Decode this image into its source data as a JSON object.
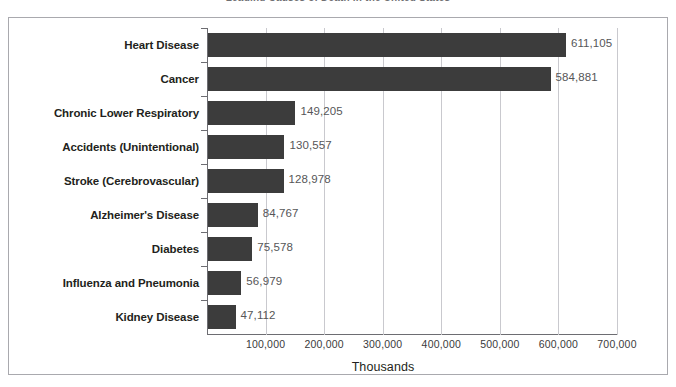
{
  "chart_data": {
    "type": "bar",
    "orientation": "horizontal",
    "title": "Leading Causes of Death in the United States",
    "xlabel": "Thousands",
    "ylabel": "",
    "xlim": [
      0,
      700000
    ],
    "xticks": [
      100000,
      200000,
      300000,
      400000,
      500000,
      600000,
      700000
    ],
    "xtick_labels": [
      "100,000",
      "200,000",
      "300,000",
      "400,000",
      "500,000",
      "600,000",
      "700,000"
    ],
    "grid": true,
    "legend": false,
    "bar_color": "#3c3c3c",
    "categories": [
      "Heart Disease",
      "Cancer",
      "Chronic Lower Respiratory",
      "Accidents (Unintentional)",
      "Stroke (Cerebrovascular)",
      "Alzheimer's Disease",
      "Diabetes",
      "Influenza and Pneumonia",
      "Kidney Disease"
    ],
    "values": [
      611105,
      584881,
      149205,
      130557,
      128978,
      84767,
      75578,
      56979,
      47112
    ],
    "value_labels": [
      "611,105",
      "584,881",
      "149,205",
      "130,557",
      "128,978",
      "84,767",
      "75,578",
      "56,979",
      "47,112"
    ]
  }
}
